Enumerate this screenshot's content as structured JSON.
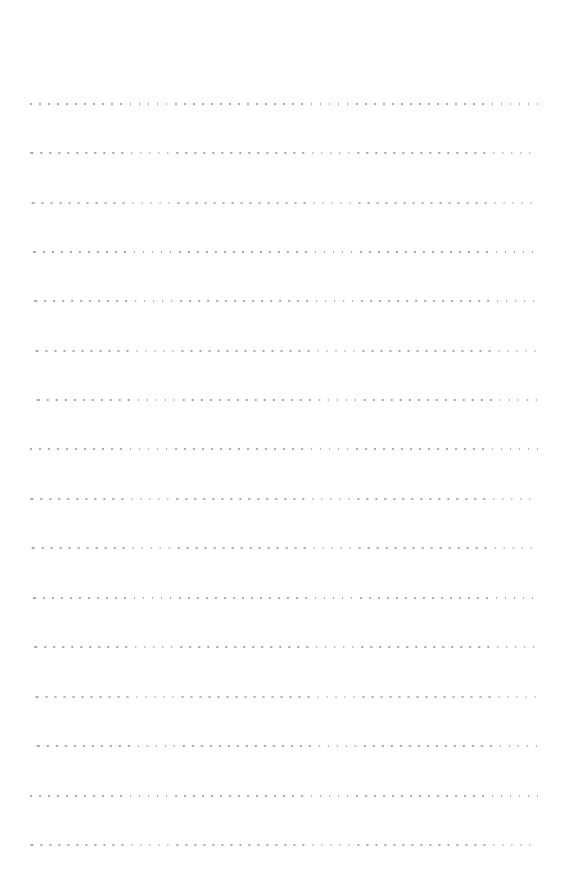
{
  "page": {
    "kind": "blank-lined-paper",
    "width": 569,
    "height": 885,
    "background_color": "#ffffff",
    "orientation": "portrait"
  },
  "ruling": {
    "style": "dotted",
    "dot_color": "#a0a0a0",
    "dot_size_px": 1.7,
    "dot_pitch_px": 9.05,
    "line_thickness_px": 2,
    "line_count": 16,
    "left_margin_px": 30,
    "right_edge_px": 538,
    "line_length_px": 508,
    "first_line_y_px": 103,
    "last_line_y_px": 844,
    "line_spacing_px": 49.4,
    "top_margin_px": 103,
    "bottom_margin_px": 41
  },
  "lines": [
    {
      "index": 1,
      "y": 103,
      "x": 30,
      "width": 508,
      "text": ""
    },
    {
      "index": 2,
      "y": 152,
      "x": 30,
      "width": 508,
      "text": ""
    },
    {
      "index": 3,
      "y": 202,
      "x": 30,
      "width": 508,
      "text": ""
    },
    {
      "index": 4,
      "y": 251,
      "x": 30,
      "width": 508,
      "text": ""
    },
    {
      "index": 5,
      "y": 300,
      "x": 30,
      "width": 508,
      "text": ""
    },
    {
      "index": 6,
      "y": 350,
      "x": 30,
      "width": 508,
      "text": ""
    },
    {
      "index": 7,
      "y": 399,
      "x": 30,
      "width": 508,
      "text": ""
    },
    {
      "index": 8,
      "y": 448,
      "x": 30,
      "width": 508,
      "text": ""
    },
    {
      "index": 9,
      "y": 498,
      "x": 30,
      "width": 508,
      "text": ""
    },
    {
      "index": 10,
      "y": 547,
      "x": 30,
      "width": 508,
      "text": ""
    },
    {
      "index": 11,
      "y": 597,
      "x": 30,
      "width": 508,
      "text": ""
    },
    {
      "index": 12,
      "y": 646,
      "x": 30,
      "width": 508,
      "text": ""
    },
    {
      "index": 13,
      "y": 696,
      "x": 30,
      "width": 508,
      "text": ""
    },
    {
      "index": 14,
      "y": 745,
      "x": 30,
      "width": 508,
      "text": ""
    },
    {
      "index": 15,
      "y": 795,
      "x": 30,
      "width": 508,
      "text": ""
    },
    {
      "index": 16,
      "y": 844,
      "x": 30,
      "width": 508,
      "text": ""
    }
  ]
}
